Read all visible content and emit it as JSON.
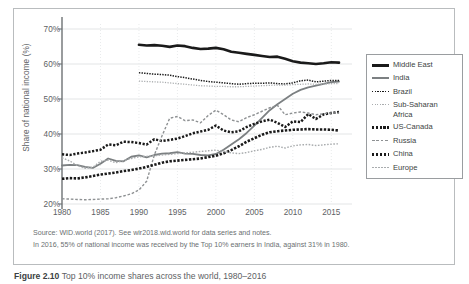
{
  "chart_data": {
    "type": "line",
    "title": "",
    "xlabel": "",
    "ylabel": "Share of national income (%)",
    "xlim": [
      1980,
      2016
    ],
    "ylim": [
      20,
      70
    ],
    "y_ticks": [
      "20%",
      "30%",
      "40%",
      "50%",
      "60%",
      "70%"
    ],
    "y_tick_values": [
      20,
      30,
      40,
      50,
      60,
      70
    ],
    "x_ticks": [
      "1980",
      "1985",
      "1990",
      "1995",
      "2000",
      "2005",
      "2010",
      "2015"
    ],
    "x_tick_values": [
      1980,
      1985,
      1990,
      1995,
      2000,
      2005,
      2010,
      2015
    ],
    "grid": true,
    "legend_position": "right",
    "series": [
      {
        "name": "Middle East",
        "style": "thick-solid",
        "color": "#1a1a1a",
        "x": [
          1990,
          1991,
          1992,
          1993,
          1994,
          1995,
          1996,
          1997,
          1998,
          1999,
          2000,
          2001,
          2002,
          2003,
          2004,
          2005,
          2006,
          2007,
          2008,
          2009,
          2010,
          2011,
          2012,
          2013,
          2014,
          2015,
          2016
        ],
        "values": [
          65.5,
          65.3,
          65.4,
          65.2,
          64.9,
          65.3,
          65.1,
          64.6,
          64.3,
          64.4,
          64.6,
          64.2,
          63.5,
          63.2,
          62.9,
          62.6,
          62.3,
          62.0,
          62.1,
          61.5,
          60.8,
          60.4,
          60.2,
          60.0,
          60.2,
          60.5,
          60.4
        ]
      },
      {
        "name": "India",
        "style": "medium-solid",
        "color": "#7c8082",
        "x": [
          1980,
          1981,
          1982,
          1983,
          1984,
          1985,
          1986,
          1987,
          1988,
          1989,
          1990,
          1991,
          1992,
          1993,
          1994,
          1995,
          1996,
          1997,
          1998,
          1999,
          2000,
          2001,
          2002,
          2003,
          2004,
          2005,
          2006,
          2007,
          2008,
          2009,
          2010,
          2011,
          2012,
          2013,
          2014,
          2015,
          2016
        ],
        "values": [
          31.0,
          31.2,
          31.1,
          30.6,
          30.3,
          31.5,
          33.0,
          32.3,
          32.2,
          33.5,
          33.9,
          33.3,
          34.0,
          34.4,
          34.5,
          34.8,
          34.4,
          34.3,
          34.0,
          33.9,
          34.3,
          35.5,
          37.0,
          38.5,
          40.3,
          42.4,
          44.6,
          46.8,
          48.5,
          50.0,
          51.5,
          52.6,
          53.3,
          53.8,
          54.3,
          54.8,
          55.0
        ]
      },
      {
        "name": "Brazil",
        "style": "fine-dot-black",
        "color": "#1a1a1a",
        "x": [
          1990,
          1991,
          1992,
          1993,
          1994,
          1995,
          1996,
          1997,
          1998,
          1999,
          2000,
          2001,
          2002,
          2003,
          2004,
          2005,
          2006,
          2007,
          2008,
          2009,
          2010,
          2011,
          2012,
          2013,
          2014,
          2015,
          2016
        ],
        "values": [
          57.5,
          57.3,
          57.1,
          57.0,
          56.8,
          56.4,
          56.1,
          55.7,
          55.3,
          55.0,
          54.8,
          54.6,
          54.4,
          54.2,
          54.4,
          54.5,
          54.5,
          54.6,
          54.4,
          54.3,
          54.6,
          55.2,
          55.4,
          54.9,
          55.1,
          55.3,
          55.3
        ]
      },
      {
        "name": "Sub-Saharan Africa",
        "style": "fine-dot-gray",
        "color": "#a9acae",
        "x": [
          1990,
          1991,
          1992,
          1993,
          1994,
          1995,
          1996,
          1997,
          1998,
          1999,
          2000,
          2001,
          2002,
          2003,
          2004,
          2005,
          2006,
          2007,
          2008,
          2009,
          2010,
          2011,
          2012,
          2013,
          2014,
          2015,
          2016
        ],
        "values": [
          55.1,
          55.0,
          54.9,
          54.8,
          54.6,
          54.4,
          54.2,
          54.0,
          53.8,
          53.7,
          53.6,
          53.6,
          53.5,
          53.5,
          53.6,
          53.7,
          53.8,
          53.9,
          54.0,
          54.0,
          54.1,
          54.2,
          54.3,
          54.2,
          54.3,
          54.4,
          54.4
        ]
      },
      {
        "name": "US-Canada",
        "style": "heavy-dot-black",
        "color": "#1a1a1a",
        "x": [
          1980,
          1981,
          1982,
          1983,
          1984,
          1985,
          1986,
          1987,
          1988,
          1989,
          1990,
          1991,
          1992,
          1993,
          1994,
          1995,
          1996,
          1997,
          1998,
          1999,
          2000,
          2001,
          2002,
          2003,
          2004,
          2005,
          2006,
          2007,
          2008,
          2009,
          2010,
          2011,
          2012,
          2013,
          2014,
          2015,
          2016
        ],
        "values": [
          34.2,
          34.0,
          34.4,
          34.7,
          35.1,
          35.5,
          37.0,
          36.8,
          37.8,
          37.7,
          37.4,
          37.0,
          38.5,
          38.0,
          38.3,
          38.7,
          39.4,
          40.2,
          40.7,
          41.2,
          42.4,
          41.0,
          40.5,
          40.8,
          42.0,
          42.9,
          43.6,
          44.1,
          43.2,
          42.0,
          43.6,
          43.4,
          45.7,
          44.3,
          45.6,
          46.0,
          46.3
        ]
      },
      {
        "name": "Russia",
        "style": "dash-gray",
        "color": "#8e9193",
        "x": [
          1980,
          1981,
          1982,
          1983,
          1984,
          1985,
          1986,
          1987,
          1988,
          1989,
          1990,
          1991,
          1992,
          1993,
          1994,
          1995,
          1996,
          1997,
          1998,
          1999,
          2000,
          2001,
          2002,
          2003,
          2004,
          2005,
          2006,
          2007,
          2008,
          2009,
          2010,
          2011,
          2012,
          2013,
          2014,
          2015,
          2016
        ],
        "values": [
          21.5,
          21.4,
          21.3,
          21.2,
          21.3,
          21.4,
          21.5,
          21.8,
          22.3,
          22.9,
          24.0,
          26.5,
          34.0,
          39.5,
          44.5,
          45.0,
          43.8,
          44.0,
          43.2,
          45.3,
          46.8,
          45.5,
          44.0,
          43.5,
          44.7,
          45.5,
          46.5,
          47.5,
          48.2,
          45.5,
          46.0,
          46.3,
          46.0,
          45.5,
          45.8,
          46.0,
          46.0
        ]
      },
      {
        "name": "China",
        "style": "heavy-dot-black2",
        "color": "#1a1a1a",
        "x": [
          1980,
          1981,
          1982,
          1983,
          1984,
          1985,
          1986,
          1987,
          1988,
          1989,
          1990,
          1991,
          1992,
          1993,
          1994,
          1995,
          1996,
          1997,
          1998,
          1999,
          2000,
          2001,
          2002,
          2003,
          2004,
          2005,
          2006,
          2007,
          2008,
          2009,
          2010,
          2011,
          2012,
          2013,
          2014,
          2015,
          2016
        ],
        "values": [
          27.2,
          27.4,
          27.3,
          27.6,
          28.0,
          28.4,
          28.7,
          29.0,
          29.4,
          29.7,
          30.1,
          30.6,
          31.2,
          31.8,
          32.2,
          32.4,
          32.6,
          32.8,
          33.0,
          33.4,
          33.8,
          34.5,
          35.4,
          36.5,
          37.8,
          38.8,
          39.8,
          40.5,
          40.8,
          41.0,
          41.2,
          41.3,
          41.4,
          41.3,
          41.3,
          41.2,
          41.0
        ]
      },
      {
        "name": "Europe",
        "style": "fine-dot-gray2",
        "color": "#a9acae",
        "x": [
          1980,
          1981,
          1982,
          1983,
          1984,
          1985,
          1986,
          1987,
          1988,
          1989,
          1990,
          1991,
          1992,
          1993,
          1994,
          1995,
          1996,
          1997,
          1998,
          1999,
          2000,
          2001,
          2002,
          2003,
          2004,
          2005,
          2006,
          2007,
          2008,
          2009,
          2010,
          2011,
          2012,
          2013,
          2014,
          2015,
          2016
        ],
        "values": [
          33.2,
          32.3,
          31.0,
          30.2,
          30.5,
          32.2,
          32.5,
          31.8,
          32.4,
          33.0,
          33.5,
          33.6,
          33.8,
          34.0,
          34.2,
          34.4,
          34.6,
          34.8,
          35.0,
          35.2,
          35.4,
          35.0,
          34.6,
          34.4,
          34.7,
          35.2,
          35.6,
          36.2,
          36.5,
          36.0,
          36.6,
          36.9,
          37.0,
          36.7,
          36.9,
          37.1,
          37.2
        ]
      }
    ]
  },
  "legend": {
    "items": [
      {
        "label": "Middle East",
        "swatch": "thick-solid"
      },
      {
        "label": "India",
        "swatch": "medium-solid"
      },
      {
        "label": "Brazil",
        "swatch": "fine-dot-black"
      },
      {
        "label": "Sub-Saharan Africa",
        "swatch": "fine-dot-gray"
      },
      {
        "label": "US-Canada",
        "swatch": "heavy-dot-black"
      },
      {
        "label": "Russia",
        "swatch": "dash-gray"
      },
      {
        "label": "China",
        "swatch": "heavy-dot-black2"
      },
      {
        "label": "Europe",
        "swatch": "fine-dot-gray2"
      }
    ]
  },
  "notes": {
    "source": "Source: WID.world (2017). See wir2018.wid.world for data series and notes.",
    "reading": "In 2016, 55% of national income was received by the Top 10% earners in India, against 31% in 1980."
  },
  "caption": {
    "number": "Figure 2.10",
    "rest": "Top 10% income shares across the world, 1980–2016"
  }
}
